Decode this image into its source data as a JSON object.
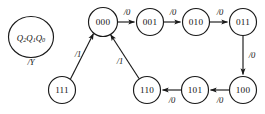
{
  "diagram": {
    "type": "finite-state-machine",
    "legend": {
      "state_label_main": "Q",
      "state_label_sub2": "2",
      "state_label_mid": "Q",
      "state_label_sub1": "1",
      "state_label_last": "Q",
      "state_label_sub0": "0",
      "state_label_full": "Q2Q1Q0",
      "output_label": "/Y"
    },
    "colors": {
      "stroke": "#1a1a1a",
      "text": "#111111",
      "background": "#ffffff"
    },
    "nodes": [
      {
        "id": "n000",
        "label": "000",
        "cx": 103,
        "cy": 22,
        "r": 14.5
      },
      {
        "id": "n001",
        "label": "001",
        "cx": 150,
        "cy": 22,
        "r": 13.5
      },
      {
        "id": "n010",
        "label": "010",
        "cx": 196,
        "cy": 22,
        "r": 13.5
      },
      {
        "id": "n011",
        "label": "011",
        "cx": 243,
        "cy": 22,
        "r": 13.5
      },
      {
        "id": "n100",
        "label": "100",
        "cx": 243,
        "cy": 90,
        "r": 13.5
      },
      {
        "id": "n101",
        "label": "101",
        "cx": 195,
        "cy": 90,
        "r": 13.5
      },
      {
        "id": "n110",
        "label": "110",
        "cx": 147,
        "cy": 90,
        "r": 13.5
      },
      {
        "id": "n111",
        "label": "111",
        "cx": 62,
        "cy": 90,
        "r": 13.5
      }
    ],
    "edges": [
      {
        "id": "e000-001",
        "from": "000",
        "to": "001",
        "label": "/0",
        "label_x": 127,
        "label_y": 13
      },
      {
        "id": "e001-010",
        "from": "001",
        "to": "010",
        "label": "/0",
        "label_x": 173,
        "label_y": 13
      },
      {
        "id": "e010-011",
        "from": "010",
        "to": "011",
        "label": "/0",
        "label_x": 220,
        "label_y": 13
      },
      {
        "id": "e011-100",
        "from": "011",
        "to": "100",
        "label": "/0",
        "label_x": 252,
        "label_y": 56
      },
      {
        "id": "e100-101",
        "from": "100",
        "to": "101",
        "label": "/0",
        "label_x": 220,
        "label_y": 101
      },
      {
        "id": "e101-110",
        "from": "101",
        "to": "110",
        "label": "/0",
        "label_x": 172,
        "label_y": 101
      },
      {
        "id": "e110-000",
        "from": "110",
        "to": "000",
        "label": "/1",
        "label_x": 120,
        "label_y": 62
      },
      {
        "id": "e111-000",
        "from": "111",
        "to": "000",
        "label": "/1",
        "label_x": 78,
        "label_y": 55
      }
    ]
  }
}
